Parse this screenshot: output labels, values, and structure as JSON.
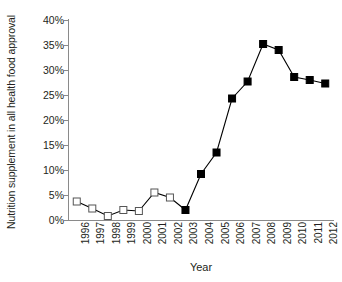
{
  "chart_data": {
    "type": "line",
    "title": "",
    "xlabel": "Year",
    "ylabel": "Nutrition supplement in all health food approval",
    "x": [
      1996,
      1997,
      1998,
      1999,
      2000,
      2001,
      2002,
      2003,
      2004,
      2005,
      2006,
      2007,
      2008,
      2009,
      2010,
      2011,
      2012
    ],
    "categories": [
      "1996",
      "1997",
      "1998",
      "1999",
      "2000",
      "2001",
      "2002",
      "2003",
      "2004",
      "2005",
      "2006",
      "2007",
      "2008",
      "2009",
      "2010",
      "2011",
      "2012"
    ],
    "values": [
      3.7,
      2.3,
      0.8,
      2.0,
      1.8,
      5.5,
      4.5,
      2.0,
      9.2,
      13.5,
      24.3,
      27.7,
      35.2,
      34.0,
      28.6,
      28.0,
      27.3
    ],
    "ylim": [
      0,
      40
    ],
    "yticks": [
      0,
      5,
      10,
      15,
      20,
      25,
      30,
      35,
      40
    ],
    "ytick_labels": [
      "0%",
      "5%",
      "10%",
      "15%",
      "20%",
      "25%",
      "30%",
      "35%",
      "40%"
    ],
    "grid": false,
    "legend": false,
    "line_color": "#000000",
    "marker_open_years": [
      1996,
      1997,
      1998,
      1999,
      2000,
      2001,
      2002
    ],
    "marker_filled_years": [
      2003,
      2004,
      2005,
      2006,
      2007,
      2008,
      2009,
      2010,
      2011,
      2012
    ],
    "marker_open_edge_color": "#555555",
    "marker_filled_color": "#000000",
    "axis_color": "#8a8a8a"
  }
}
